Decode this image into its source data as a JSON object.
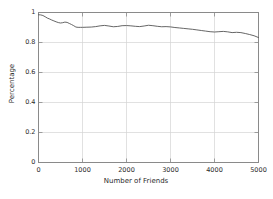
{
  "figure": {
    "background_color": "#ffffff",
    "frame_color": "#8a8a8a",
    "grid_color": "#d4d4d4",
    "line_color": "#555555",
    "text_color": "#2b2b2b"
  },
  "axes": {
    "x_label": "Number of Friends",
    "y_label": "Percentage",
    "x_ticks": [
      "0",
      "1000",
      "2000",
      "3000",
      "4000",
      "5000"
    ],
    "y_ticks": [
      "0",
      "0.2",
      "0.4",
      "0.6",
      "0.8",
      "1"
    ]
  },
  "chart_data": {
    "type": "line",
    "title": "",
    "xlabel": "Number of Friends",
    "ylabel": "Percentage",
    "xlim": [
      0,
      5000
    ],
    "ylim": [
      0,
      1
    ],
    "xticks": [
      0,
      1000,
      2000,
      3000,
      4000,
      5000
    ],
    "yticks": [
      0,
      0.2,
      0.4,
      0.6,
      0.8,
      1
    ],
    "grid": true,
    "legend": false,
    "legend_position": "none",
    "series": [
      {
        "name": "percentage",
        "x": [
          0,
          50,
          100,
          150,
          200,
          250,
          300,
          350,
          400,
          450,
          500,
          550,
          600,
          650,
          700,
          750,
          800,
          850,
          900,
          950,
          1000,
          1100,
          1200,
          1300,
          1400,
          1500,
          1600,
          1700,
          1800,
          1900,
          2000,
          2100,
          2200,
          2300,
          2400,
          2500,
          2600,
          2700,
          2800,
          2900,
          3000,
          3100,
          3200,
          3300,
          3400,
          3500,
          3600,
          3700,
          3800,
          3900,
          4000,
          4100,
          4200,
          4300,
          4400,
          4500,
          4600,
          4700,
          4800,
          4900,
          5000
        ],
        "y": [
          0.985,
          0.984,
          0.98,
          0.972,
          0.963,
          0.957,
          0.95,
          0.944,
          0.938,
          0.933,
          0.93,
          0.932,
          0.936,
          0.934,
          0.927,
          0.92,
          0.912,
          0.903,
          0.901,
          0.901,
          0.901,
          0.902,
          0.903,
          0.906,
          0.911,
          0.914,
          0.91,
          0.905,
          0.907,
          0.912,
          0.913,
          0.911,
          0.908,
          0.906,
          0.91,
          0.915,
          0.912,
          0.908,
          0.905,
          0.906,
          0.904,
          0.9,
          0.897,
          0.894,
          0.891,
          0.888,
          0.884,
          0.88,
          0.876,
          0.872,
          0.87,
          0.872,
          0.874,
          0.871,
          0.866,
          0.868,
          0.866,
          0.86,
          0.853,
          0.845,
          0.833
        ]
      }
    ]
  }
}
